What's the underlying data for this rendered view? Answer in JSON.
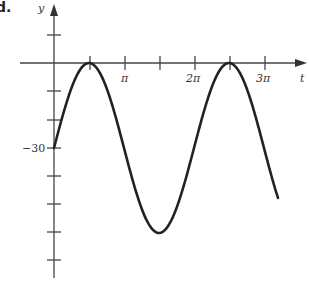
{
  "figure": {
    "part_label": "d.",
    "x_axis_label": "t",
    "y_axis_label": "y",
    "y_tick_label": "−30",
    "x_tick_labels": [
      "π",
      "2π",
      "3π"
    ]
  },
  "chart_data": {
    "type": "line",
    "title": "",
    "xlabel": "t",
    "ylabel": "y",
    "function": "y = 30 sin(t) - 30",
    "x_ticks": [
      "π/2",
      "π",
      "3π/2",
      "2π",
      "5π/2",
      "3π"
    ],
    "x_tick_labels": {
      "3.14159": "π",
      "6.28319": "2π",
      "9.42478": "3π"
    },
    "y_ticks": [
      10,
      0,
      -10,
      -20,
      -30,
      -40,
      -50,
      -60,
      -70
    ],
    "y_tick_labels": {
      "-30": "−30"
    },
    "xlim": [
      0,
      3.3
    ],
    "xlim_units": "multiples of pi",
    "ylim": [
      -72,
      14
    ],
    "grid": false,
    "legend": null,
    "series": [
      {
        "name": "y(t)",
        "x": [
          0,
          0.5,
          1.0,
          1.5,
          2.0,
          2.5,
          3.0,
          3.2
        ],
        "x_units": "multiples of pi",
        "values": [
          -30,
          0,
          -30,
          -60,
          -30,
          0,
          -30,
          -47.6
        ]
      }
    ],
    "key_points": [
      {
        "t": "0",
        "y": -30,
        "note": "y-intercept"
      },
      {
        "t": "π/2",
        "y": 0,
        "note": "maximum"
      },
      {
        "t": "3π/2",
        "y": -60,
        "note": "minimum"
      },
      {
        "t": "5π/2",
        "y": 0,
        "note": "maximum"
      }
    ]
  }
}
